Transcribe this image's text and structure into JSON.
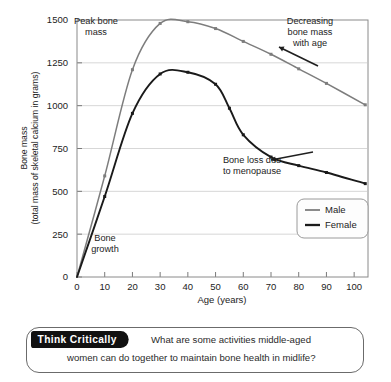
{
  "chart_data": {
    "type": "line",
    "title": "",
    "subtitle": "",
    "xlabel": "Age (years)",
    "ylabel_line1": "Bone mass",
    "ylabel_line2": "(total mass of skeletal calcium in grams)",
    "xlim": [
      0,
      105
    ],
    "ylim": [
      0,
      1500
    ],
    "xticks": [
      0,
      10,
      20,
      30,
      40,
      50,
      60,
      70,
      80,
      90,
      100
    ],
    "yticks": [
      0,
      250,
      500,
      750,
      1000,
      1250,
      1500
    ],
    "grid": "horizontal",
    "legend_position": "lower-right",
    "series": [
      {
        "name": "Male",
        "color": "#7d7d7d",
        "x": [
          0,
          10,
          20,
          30,
          40,
          50,
          60,
          70,
          80,
          90,
          104
        ],
        "values": [
          0,
          590,
          1210,
          1480,
          1490,
          1450,
          1375,
          1300,
          1215,
          1130,
          1005
        ]
      },
      {
        "name": "Female",
        "color": "#1a1a1a",
        "x": [
          0,
          10,
          20,
          30,
          40,
          50,
          55,
          60,
          70,
          80,
          90,
          104
        ],
        "values": [
          0,
          470,
          955,
          1185,
          1195,
          1125,
          985,
          830,
          700,
          650,
          610,
          545
        ]
      }
    ],
    "annotations": [
      {
        "id": "peak-bone-mass",
        "lines": [
          "Peak bone",
          "mass"
        ],
        "x": 96,
        "y": 24,
        "align": "center"
      },
      {
        "id": "decreasing-bone-mass",
        "lines": [
          "Decreasing",
          "bone mass",
          "with age"
        ],
        "x": 310,
        "y": 24,
        "align": "center"
      },
      {
        "id": "bone-loss-menopause",
        "lines": [
          "Bone loss due",
          "to menopause"
        ],
        "x": 252,
        "y": 163,
        "align": "center"
      },
      {
        "id": "bone-growth",
        "lines": [
          "Bone",
          "growth"
        ],
        "x": 105,
        "y": 241,
        "align": "center"
      }
    ]
  },
  "legend": {
    "items": [
      {
        "label": "Male",
        "color": "#7d7d7d"
      },
      {
        "label": "Female",
        "color": "#1a1a1a"
      }
    ]
  },
  "callout": {
    "tag": "Think Critically",
    "question_line1": "What are some activities middle-aged",
    "question_line2": "women can do together to maintain bone health in midlife?"
  }
}
